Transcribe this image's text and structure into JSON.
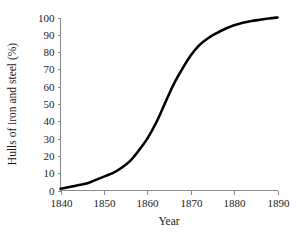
{
  "chart_data": {
    "type": "line",
    "title": "",
    "xlabel": "Year",
    "ylabel": "Hulls of iron and steel (%)",
    "xlim": [
      1840,
      1890
    ],
    "ylim": [
      0,
      100
    ],
    "grid": false,
    "legend": null,
    "legend_position": "none",
    "line_color": "#000000",
    "axis_color": "#8a8a8a",
    "xticks": [
      1840,
      1850,
      1860,
      1870,
      1880,
      1890
    ],
    "xtick_labels": [
      "1840",
      "1850",
      "1860",
      "1870",
      "1880",
      "1890"
    ],
    "yticks": [
      0,
      10,
      20,
      30,
      40,
      50,
      60,
      70,
      80,
      90,
      100
    ],
    "ytick_labels": [
      "0",
      "10",
      "20",
      "30",
      "40",
      "50",
      "60",
      "70",
      "80",
      "90",
      "100"
    ],
    "series": [
      {
        "name": "Hulls of iron and steel",
        "x": [
          1840,
          1842,
          1844,
          1846,
          1848,
          1850,
          1852,
          1854,
          1856,
          1858,
          1860,
          1862,
          1864,
          1866,
          1868,
          1870,
          1872,
          1874,
          1876,
          1878,
          1880,
          1882,
          1884,
          1886,
          1888,
          1890
        ],
        "values": [
          1,
          2,
          3,
          4,
          6,
          8,
          10,
          13,
          17,
          23,
          30,
          39,
          50,
          61,
          70,
          78,
          84,
          88,
          91,
          93.5,
          95.5,
          97,
          98,
          98.7,
          99.4,
          100
        ]
      }
    ],
    "annotations": []
  },
  "figure": {
    "caption": ""
  }
}
